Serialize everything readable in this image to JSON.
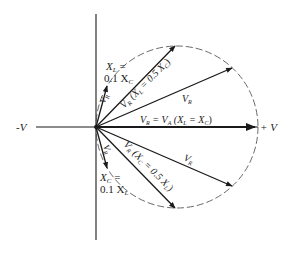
{
  "diagram": {
    "type": "phasor-diagram",
    "axis_labels": {
      "negative": "-V",
      "positive": "+ V"
    },
    "labels": {
      "xl_small_line1": "X",
      "xl_small_sub1": "L",
      "xl_small_eq": " =",
      "xl_small_line2": "0.1 X",
      "xl_small_sub2": "C",
      "vr_top_small": "V",
      "vr_top_small_sub": "R",
      "vr_half_top": "V",
      "vr_half_top_sub": "R",
      "vr_half_top_paren": "(X",
      "vr_half_top_paren_sub": "L",
      "vr_half_top_rest": " = 0.5 X",
      "vr_half_top_rest_sub": "C",
      "vr_half_top_close": ")",
      "vr_upper": "V",
      "vr_upper_sub": "R",
      "vr_eq_va_1": "V",
      "vr_eq_va_1_sub": "R",
      "vr_eq_va_2": " = V",
      "vr_eq_va_2_sub": "A",
      "vr_eq_va_3": " (X",
      "vr_eq_va_3_sub": "L",
      "vr_eq_va_4": " = X",
      "vr_eq_va_4_sub": "C",
      "vr_eq_va_5": ")",
      "vr_lower": "V",
      "vr_lower_sub": "R",
      "vr_half_bot": "V",
      "vr_half_bot_sub": "R",
      "vr_half_bot_paren": "(X",
      "vr_half_bot_paren_sub": "C",
      "vr_half_bot_rest": " = 0.5 X",
      "vr_half_bot_rest_sub": "L",
      "vr_half_bot_close": ")",
      "vr_bot_small": "V",
      "vr_bot_small_sub": "R",
      "xc_small_line1": "X",
      "xc_small_sub1": "C",
      "xc_small_eq": " =",
      "xc_small_line2": "0.1 X",
      "xc_small_sub2": "L"
    },
    "colors": {
      "line": "#1a1a1a",
      "circle": "#444444",
      "background": "#ffffff"
    }
  }
}
